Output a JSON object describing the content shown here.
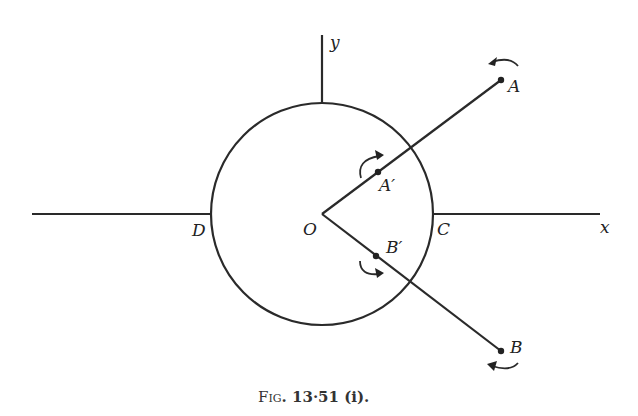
{
  "figure": {
    "caption": "Fig. 13·51 (i).",
    "caption_parts": {
      "fig": "F",
      "ig": "IG",
      "rest": ". 13·51 (i)."
    },
    "labels": {
      "y_axis": "y",
      "x_axis": "x",
      "origin": "O",
      "A": "A",
      "A_prime": "A′",
      "B": "B",
      "B_prime": "B′",
      "C": "C",
      "D": "D"
    },
    "elements": {
      "circle": {
        "center": [
          322,
          214
        ],
        "radius": 111
      },
      "x_axis_left": [
        [
          32,
          214
        ],
        [
          211,
          214
        ]
      ],
      "x_axis_right": [
        [
          433,
          214
        ],
        [
          600,
          214
        ]
      ],
      "y_axis_top": [
        [
          322,
          35
        ],
        [
          322,
          103
        ]
      ],
      "ray_OA": [
        [
          322,
          214
        ],
        [
          501,
          80
        ]
      ],
      "ray_OB": [
        [
          322,
          214
        ],
        [
          501,
          351
        ]
      ],
      "points": {
        "A": [
          501,
          80
        ],
        "A_prime": [
          378,
          172
        ],
        "B": [
          501,
          351
        ],
        "B_prime": [
          376,
          256
        ]
      }
    }
  }
}
